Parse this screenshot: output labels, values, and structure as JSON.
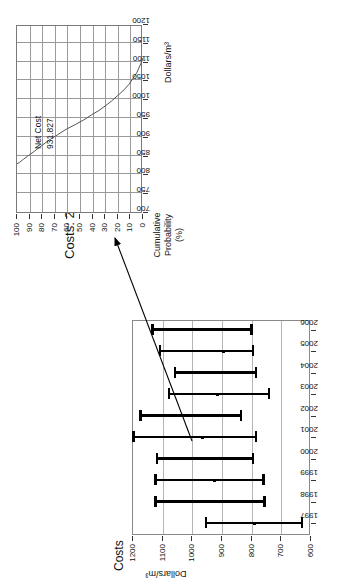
{
  "figure": {
    "orientation": "rotated-90-ccw",
    "background": "#ffffff",
    "ink_color": "#000000"
  },
  "top_chart": {
    "title": "Costs: 2000",
    "annotation_label": "Net Cost",
    "annotation_value": "931.827",
    "x_axis_name": "Dollars/m³",
    "y_axis_name_line1": "Cumulative",
    "y_axis_name_line2": "Probability",
    "y_axis_name_line3": "(%)",
    "x_ticks": [
      "700",
      "750",
      "800",
      "850",
      "900",
      "950",
      "1000",
      "1050",
      "1100",
      "1150",
      "1200"
    ],
    "y_ticks": [
      "0",
      "10",
      "20",
      "30",
      "40",
      "50",
      "60",
      "70",
      "80",
      "90",
      "100"
    ]
  },
  "bottom_chart": {
    "title": "Costs",
    "y_axis_name": "Dollars/m³",
    "y_ticks": [
      "600",
      "700",
      "800",
      "900",
      "1000",
      "1100",
      "1200"
    ],
    "x_ticks": [
      "1997",
      "1998",
      "1999",
      "2000",
      "2001",
      "2002",
      "2003",
      "2004",
      "2005",
      "2006"
    ]
  },
  "chart_data": [
    {
      "type": "line",
      "id": "cumulative-probability-curve",
      "title": "Costs: 2000",
      "xlabel": "Dollars/m³",
      "ylabel": "Cumulative Probability (%)",
      "xlim": [
        700,
        1200
      ],
      "ylim": [
        0,
        100
      ],
      "grid": true,
      "legend": "none",
      "annotations": [
        {
          "text": "Net Cost",
          "value": "931.827"
        }
      ],
      "x": [
        828,
        832,
        840,
        850,
        862,
        875,
        890,
        905,
        920,
        932,
        945,
        958,
        970,
        982,
        995,
        1010,
        1025,
        1040,
        1055,
        1070,
        1085,
        1100,
        1110
      ],
      "y": [
        100,
        98,
        95,
        91,
        86,
        81,
        75,
        68,
        61,
        54,
        47,
        41,
        35,
        30,
        25,
        20,
        15,
        11,
        8,
        5,
        3,
        1,
        0
      ]
    },
    {
      "type": "bar",
      "id": "costs-by-year-error-bars",
      "subtype": "error-bar",
      "title": "Costs",
      "xlabel": "",
      "ylabel": "Dollars/m³",
      "ylim": [
        600,
        1200
      ],
      "grid": true,
      "legend": "none",
      "categories": [
        "1997",
        "1998",
        "1999",
        "2000",
        "2001",
        "2002",
        "2003",
        "2004",
        "2005",
        "2006"
      ],
      "series": [
        {
          "name": "mean",
          "values": [
            790,
            930,
            925,
            935,
            965,
            960,
            915,
            900,
            895,
            905
          ]
        },
        {
          "name": "low",
          "values": [
            630,
            755,
            760,
            795,
            785,
            835,
            740,
            785,
            795,
            800
          ]
        },
        {
          "name": "high",
          "values": [
            955,
            1125,
            1125,
            1120,
            1200,
            1175,
            1080,
            1060,
            1110,
            1135
          ]
        }
      ]
    }
  ],
  "callout": {
    "name": "arrow-from-2000-bar-to-top-chart"
  }
}
